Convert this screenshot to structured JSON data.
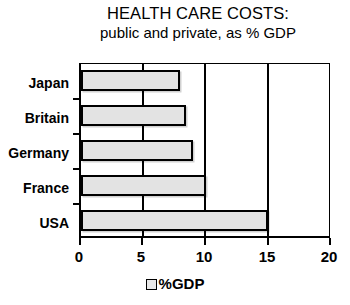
{
  "chart_data": {
    "type": "bar",
    "orientation": "horizontal",
    "title": "HEALTH CARE COSTS:",
    "subtitle": "public and private, as % GDP",
    "categories": [
      "Japan",
      "Britain",
      "Germany",
      "France",
      "USA"
    ],
    "values": [
      8.0,
      8.5,
      9.0,
      10.1,
      15.1
    ],
    "series": [
      {
        "name": "%GDP",
        "values": [
          8.0,
          8.5,
          9.0,
          10.1,
          15.1
        ]
      }
    ],
    "xlabel": "",
    "ylabel": "",
    "xlim": [
      0,
      20
    ],
    "xticks": [
      "0",
      "5",
      "10",
      "15",
      "20"
    ],
    "xtick_values": [
      0,
      5,
      10,
      15,
      20
    ],
    "grid": "vertical",
    "legend": {
      "position": "bottom",
      "entries": [
        "%GDP"
      ]
    },
    "colors": {
      "bar_fill": "#e3e3e3",
      "bar_border": "#000000",
      "background": "#ffffff",
      "text": "#000000"
    }
  }
}
